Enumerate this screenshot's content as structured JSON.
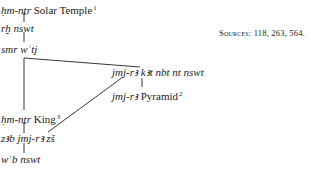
{
  "diagram": {
    "nodes": [
      {
        "id": "n1",
        "translit": "ḥm-nṯr",
        "label": "Solar Temple",
        "note": "1"
      },
      {
        "id": "n2",
        "translit": "rḫ nswt",
        "label": "",
        "note": ""
      },
      {
        "id": "n3",
        "translit": "smr wʿtj",
        "label": "",
        "note": ""
      },
      {
        "id": "n4",
        "translit": "jmj-rꜣ kꜣt nbt nt nswt",
        "label": "",
        "note": ""
      },
      {
        "id": "n5",
        "translit": "jmj-rꜣ",
        "label": "Pyramid",
        "note": "2"
      },
      {
        "id": "n6",
        "translit": "ḥm-nṯr",
        "label": "King",
        "note": "3"
      },
      {
        "id": "n7",
        "translit": "zꜣb jmj-rꜣ zš",
        "label": "",
        "note": ""
      },
      {
        "id": "n8",
        "translit": "wʿb nswt",
        "label": "",
        "note": ""
      }
    ],
    "edges": [
      [
        "n1",
        "n2"
      ],
      [
        "n2",
        "n3"
      ],
      [
        "n3",
        "n4"
      ],
      [
        "n3",
        "n6"
      ],
      [
        "n4",
        "n5"
      ],
      [
        "n4",
        "n7"
      ],
      [
        "n6",
        "n7"
      ],
      [
        "n7",
        "n8"
      ]
    ],
    "sources": "Sources: 118, 263, 564."
  }
}
